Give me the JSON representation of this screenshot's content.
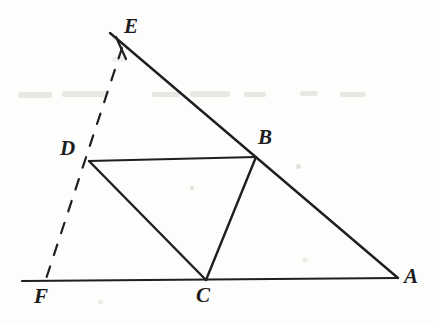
{
  "figure": {
    "background_color": "#fdfdfc",
    "stroke_color": "#1f1f1f",
    "label_color": "#1c1c1c",
    "width": 438,
    "height": 323
  },
  "labels": [
    {
      "id": "E",
      "text": "E",
      "x": 124,
      "y": 16
    },
    {
      "id": "D",
      "text": "D",
      "x": 60,
      "y": 138
    },
    {
      "id": "B",
      "text": "B",
      "x": 258,
      "y": 127
    },
    {
      "id": "F",
      "text": "F",
      "x": 34,
      "y": 286
    },
    {
      "id": "C",
      "text": "C",
      "x": 196,
      "y": 285
    },
    {
      "id": "A",
      "text": "A",
      "x": 404,
      "y": 266
    }
  ],
  "points": {
    "E_end": {
      "x": 110,
      "y": 33
    },
    "E_tick": {
      "x": 122,
      "y": 48
    },
    "D": {
      "x": 89,
      "y": 161
    },
    "B": {
      "x": 256,
      "y": 157
    },
    "C": {
      "x": 206,
      "y": 280
    },
    "A": {
      "x": 398,
      "y": 278
    },
    "F": {
      "x": 45,
      "y": 282
    },
    "F_line_left_end": {
      "x": 22,
      "y": 281
    }
  },
  "segments": [
    {
      "name": "segment-EA",
      "from": "E_end",
      "to": "A",
      "style": "solid",
      "stroke_width": 2.4
    },
    {
      "name": "segment-FA",
      "from": "F_line_left_end",
      "to": "A",
      "style": "solid",
      "stroke_width": 2.2
    },
    {
      "name": "segment-DB",
      "from": "D",
      "to": "B",
      "style": "solid",
      "stroke_width": 2.2
    },
    {
      "name": "segment-DC",
      "from": "D",
      "to": "C",
      "style": "solid",
      "stroke_width": 2.4
    },
    {
      "name": "segment-BC",
      "from": "B",
      "to": "C",
      "style": "solid",
      "stroke_width": 2.4
    },
    {
      "name": "segment-EF-dashed",
      "from": "E_tick",
      "to": "F",
      "style": "dashed",
      "stroke_width": 2.2,
      "dash_pattern": "11 12"
    }
  ],
  "tick_marks": [
    {
      "name": "tick-on-EA",
      "x1": 116,
      "y1": 37,
      "x2": 126,
      "y2": 59
    }
  ],
  "colors": {
    "ink": "#1f1f1f",
    "paper": "#fdfdfc",
    "smudge": "#d8d5d0"
  }
}
